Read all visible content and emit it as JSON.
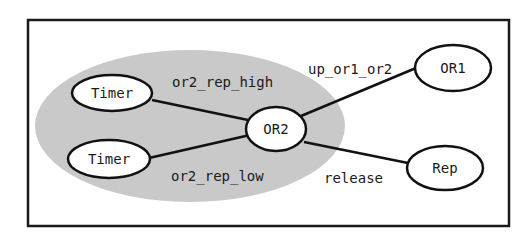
{
  "diagram": {
    "type": "state-graph",
    "colors": {
      "frame": "#1a1a1a",
      "group_fill": "#c9c9c9",
      "node_fill": "#ffffff",
      "node_stroke": "#111111",
      "edge": "#111111",
      "text": "#1a1a1a"
    },
    "group": {
      "label": "",
      "contains": [
        "timer_high",
        "timer_low",
        "or2"
      ]
    },
    "nodes": [
      {
        "id": "timer_high",
        "label": "Timer"
      },
      {
        "id": "timer_low",
        "label": "Timer"
      },
      {
        "id": "or2",
        "label": "OR2"
      },
      {
        "id": "or1",
        "label": "OR1"
      },
      {
        "id": "rep",
        "label": "Rep"
      }
    ],
    "edges": [
      {
        "from": "timer_high",
        "to": "or2",
        "label": "or2_rep_high"
      },
      {
        "from": "timer_low",
        "to": "or2",
        "label": "or2_rep_low"
      },
      {
        "from": "or2",
        "to": "or1",
        "label": "up_or1_or2"
      },
      {
        "from": "or2",
        "to": "rep",
        "label": "release"
      }
    ]
  }
}
